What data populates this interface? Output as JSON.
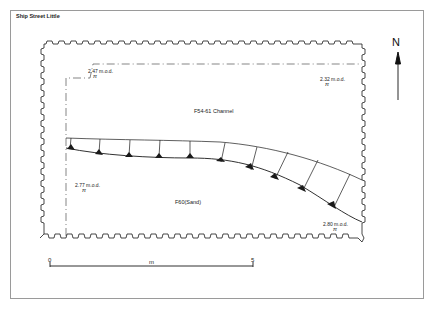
{
  "figure": {
    "title": "Ship Street Little"
  },
  "plan": {
    "labels": {
      "channel": "F54-61 Channel",
      "sand": "F60(Sand)"
    },
    "levels": [
      {
        "value": "2.47 m.o.d.",
        "symbol": "π"
      },
      {
        "value": "2.32 m.o.d.",
        "symbol": "π"
      },
      {
        "value": "2.77 m.o.d.",
        "symbol": "π"
      },
      {
        "value": "2.80 m.o.d.",
        "symbol": "π"
      }
    ]
  },
  "north_arrow": {
    "label": "N"
  },
  "scale_bar": {
    "start": "0",
    "unit": "m",
    "end": "5"
  },
  "colors": {
    "ink": "#1a1a1a",
    "frame": "#9a9a9a",
    "background": "#ffffff"
  }
}
